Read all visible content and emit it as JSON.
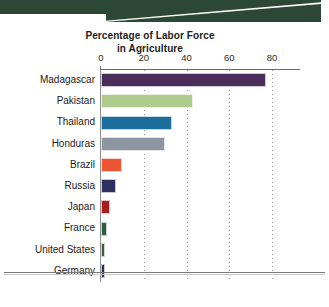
{
  "banner": {
    "name": "decorative-green-banner",
    "color": "#2c4735"
  },
  "chart_data": {
    "type": "bar",
    "orientation": "horizontal",
    "title": "Percentage of Labor Force in Agriculture",
    "title_lines": [
      "Percentage of Labor Force",
      "in Agriculture"
    ],
    "xlabel": "",
    "ylabel": "",
    "xlim": [
      0,
      80
    ],
    "xticks": [
      0,
      20,
      40,
      60,
      80
    ],
    "xtick_labels": [
      "0",
      "20",
      "40",
      "60",
      "80"
    ],
    "grid": "vertical-dotted",
    "legend": "none",
    "categories": [
      "Madagascar",
      "Pakistan",
      "Thailand",
      "Honduras",
      "Brazil",
      "Russia",
      "Japan",
      "France",
      "United States",
      "Germany"
    ],
    "values": [
      77,
      43,
      33,
      30,
      10,
      7,
      4,
      3,
      2,
      2
    ],
    "colors": [
      "#4b2d5c",
      "#aecb8d",
      "#1b6e9b",
      "#8d95a1",
      "#ee5533",
      "#2f2f60",
      "#a81d1d",
      "#2f5b3f",
      "#3a5b45",
      "#2b2b5e"
    ]
  },
  "footer": {
    "rule": "horizontal-divider"
  }
}
